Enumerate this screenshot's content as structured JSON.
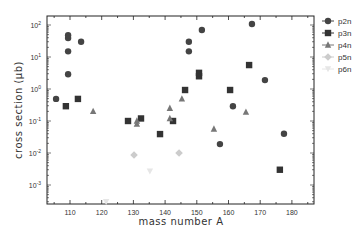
{
  "chart_data": {
    "type": "scatter",
    "title": "",
    "xlabel": "mass number A",
    "ylabel": "cross section (μb)",
    "xscale": "linear",
    "yscale": "log",
    "xlim": [
      102,
      187
    ],
    "ylim": [
      0.0002,
      300
    ],
    "xticks": [
      110,
      120,
      130,
      140,
      150,
      160,
      170,
      180
    ],
    "yticks": [
      {
        "value": 100,
        "label": "10²",
        "base": "10",
        "exp": "2"
      },
      {
        "value": 10,
        "label": "10¹",
        "base": "10",
        "exp": "1"
      },
      {
        "value": 1,
        "label": "10⁰",
        "base": "10",
        "exp": "0"
      },
      {
        "value": 0.1,
        "label": "10⁻¹",
        "base": "10",
        "exp": "-1"
      },
      {
        "value": 0.01,
        "label": "10⁻²",
        "base": "10",
        "exp": "-2"
      },
      {
        "value": 0.001,
        "label": "10⁻³",
        "base": "10",
        "exp": "-3"
      }
    ],
    "grid": false,
    "legend_position": "right-outside-top",
    "series": [
      {
        "name": "p2n",
        "marker": "circle",
        "color": "#444444",
        "points": [
          [
            105.6,
            0.49
          ],
          [
            109.4,
            2.9
          ],
          [
            109.4,
            15
          ],
          [
            109.4,
            39
          ],
          [
            109.4,
            48
          ],
          [
            113.5,
            30
          ],
          [
            147.5,
            15
          ],
          [
            147.5,
            30
          ],
          [
            151.6,
            70
          ],
          [
            157.3,
            0.019
          ],
          [
            161.4,
            0.29
          ],
          [
            167.4,
            108
          ],
          [
            171.5,
            1.9
          ],
          [
            177.5,
            0.04
          ]
        ]
      },
      {
        "name": "p3n",
        "marker": "square",
        "color": "#333333",
        "points": [
          [
            108.7,
            0.29
          ],
          [
            112.5,
            0.49
          ],
          [
            128.3,
            0.1
          ],
          [
            132.4,
            0.12
          ],
          [
            138.4,
            0.039
          ],
          [
            142.5,
            0.1
          ],
          [
            146.3,
            0.93
          ],
          [
            150.7,
            2.5
          ],
          [
            150.7,
            3.2
          ],
          [
            160.5,
            0.93
          ],
          [
            166.5,
            5.6
          ],
          [
            176.2,
            0.003
          ]
        ]
      },
      {
        "name": "p4n",
        "marker": "triangle-up",
        "color": "#777777",
        "points": [
          [
            117.3,
            0.2
          ],
          [
            131.1,
            0.08
          ],
          [
            131.1,
            0.1
          ],
          [
            141.5,
            0.12
          ],
          [
            141.5,
            0.25
          ],
          [
            145.3,
            0.49
          ],
          [
            155.4,
            0.056
          ],
          [
            165.5,
            0.19
          ]
        ]
      },
      {
        "name": "p5n",
        "marker": "diamond",
        "color": "#cccccc",
        "points": [
          [
            130.2,
            0.0087
          ],
          [
            144.4,
            0.01
          ]
        ]
      },
      {
        "name": "p6n",
        "marker": "triangle-down",
        "color": "#e6e6e6",
        "points": [
          [
            121.4,
            0.0003
          ],
          [
            135.2,
            0.0027
          ]
        ]
      }
    ]
  }
}
